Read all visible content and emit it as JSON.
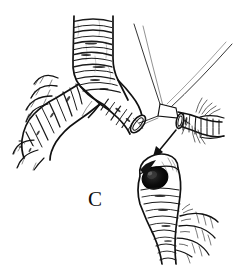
{
  "figure": {
    "title": "RESECTION",
    "panel_label": "C",
    "style": "black and white pen-and-ink medical illustration",
    "background_color": "#ffffff",
    "ink_color": "#111111"
  },
  "annotations": {
    "arrow_label": "",
    "arrow_direction": "down-left",
    "arrow_from": "resected bronchial stump at carina",
    "arrow_to": "inset detail of bronchial stump lumen"
  },
  "parts": [
    {
      "name": "trachea",
      "description": "vertical airway with horizontal cartilage rings, top center"
    },
    {
      "name": "carina",
      "description": "bifurcation of trachea into left and right main bronchi"
    },
    {
      "name": "left-main-bronchus",
      "description": "branch descending to the left with finger-like lobar branches"
    },
    {
      "name": "right-main-bronchus",
      "description": "branch descending to the right, transected at a cut end"
    },
    {
      "name": "cut-stump",
      "description": "open transected end of right main bronchus with elliptical lumen"
    },
    {
      "name": "suture-threads",
      "description": "thin converging traction threads above the cut end"
    },
    {
      "name": "resected-specimen",
      "description": "excised bronchial segment retracted to the right"
    },
    {
      "name": "inset-stump-detail",
      "description": "enlarged bronchial stump showing dark open lumen and distal branches"
    }
  ]
}
